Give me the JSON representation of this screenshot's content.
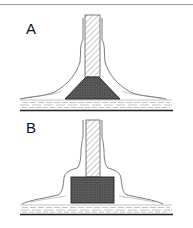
{
  "figure": {
    "panels": [
      {
        "label": "A",
        "description": "Hatched shaft on a trapezoidal dark cross-hatched base, enclosed by a flared outline, resting on a layered substrate",
        "base_shape": "trapezoid"
      },
      {
        "label": "B",
        "description": "Hatched shaft on a rectangular dark cross-hatched block, enclosed by a stepped flared outline, resting on a layered substrate",
        "base_shape": "rectangle"
      }
    ]
  },
  "colors": {
    "ink": "#222222",
    "rule": "#9a9a9a",
    "fill_dark": "#555555"
  }
}
